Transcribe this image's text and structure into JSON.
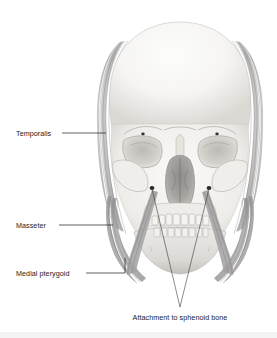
{
  "figure": {
    "view": "anterior (frontal) view of human skull",
    "background_color": "#ffffff",
    "label_color": "#1c1c1c",
    "leader_color": "#1a1a1a",
    "bone_light": "#f7f6f4",
    "bone_mid": "#d8d5d1",
    "bone_shadow": "#a8a5a2",
    "muscle_light": "#c9c7c6",
    "muscle_mid": "#a9a7a7",
    "muscle_dark": "#7e7c7d",
    "attachment_dot": "#2a2a2a"
  },
  "labels": [
    {
      "id": "temporalis",
      "text": "Temporalis",
      "text_x": 16,
      "text_y": 136,
      "leader": "M 62 133 L 106 133"
    },
    {
      "id": "masseter",
      "text": "Masseter",
      "text_x": 16,
      "text_y": 228,
      "leader": "M 59 225 L 113 225"
    },
    {
      "id": "medial-pterygoid",
      "text": "Medial pterygoid",
      "text_x": 16,
      "text_y": 276,
      "leader": "M 86 273 L 125 273 L 125 258"
    },
    {
      "id": "attachment-to-sphenoid-bone",
      "text": "Attachment to sphenoid bone",
      "text_x": 123,
      "text_y": 320,
      "leader_left": "M 152 189 L 180 307",
      "leader_right": "M 209 189 L 180 307"
    }
  ],
  "attachment_points": [
    {
      "id": "left-sphenoid-attachment",
      "cx": 152,
      "cy": 188,
      "r": 2.4
    },
    {
      "id": "right-sphenoid-attachment",
      "cx": 209,
      "cy": 188,
      "r": 2.4
    }
  ],
  "muscles": [
    {
      "id": "temporalis-left",
      "side": "left",
      "name": "Temporalis"
    },
    {
      "id": "temporalis-right",
      "side": "right",
      "name": "Temporalis"
    },
    {
      "id": "masseter-left",
      "side": "left",
      "name": "Masseter"
    },
    {
      "id": "masseter-right",
      "side": "right",
      "name": "Masseter"
    },
    {
      "id": "medial-pterygoid-left",
      "side": "left",
      "name": "Medial pterygoid"
    },
    {
      "id": "medial-pterygoid-right",
      "side": "right",
      "name": "Medial pterygoid"
    }
  ],
  "skull_parts": [
    {
      "id": "cranium",
      "name": "Cranial vault"
    },
    {
      "id": "orbit-left",
      "name": "Left orbit"
    },
    {
      "id": "orbit-right",
      "name": "Right orbit"
    },
    {
      "id": "nasal-aperture",
      "name": "Nasal aperture"
    },
    {
      "id": "zygomatic-left",
      "name": "Left zygomatic arch"
    },
    {
      "id": "zygomatic-right",
      "name": "Right zygomatic arch"
    },
    {
      "id": "maxilla",
      "name": "Maxilla with upper teeth"
    },
    {
      "id": "mandible",
      "name": "Mandible with lower teeth"
    }
  ]
}
